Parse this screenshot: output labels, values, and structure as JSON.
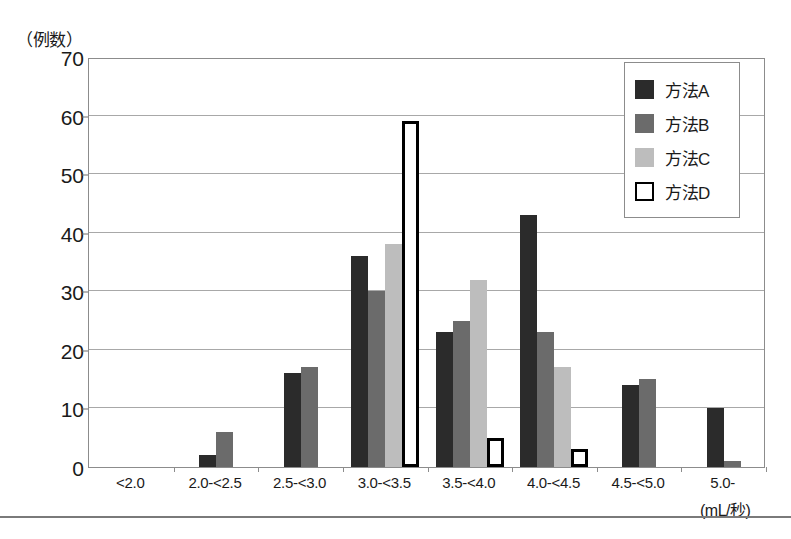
{
  "chart_data": {
    "type": "bar",
    "title": "",
    "subtitle": "",
    "xlabel": "(mL/秒)",
    "ylabel": "（例数）",
    "ylim": [
      0,
      70
    ],
    "yticks": [
      0,
      10,
      20,
      30,
      40,
      50,
      60,
      70
    ],
    "grid": true,
    "legend_position": "top-right",
    "categories": [
      "<2.0",
      "2.0-<2.5",
      "2.5-<3.0",
      "3.0-<3.5",
      "3.5-<4.0",
      "4.0-<4.5",
      "4.5-<5.0",
      "5.0-"
    ],
    "series": [
      {
        "name": "方法A",
        "color": "#2b2b2b",
        "style": "filled",
        "values": [
          0,
          2,
          16,
          36,
          23,
          43,
          14,
          10
        ]
      },
      {
        "name": "方法B",
        "color": "#6b6b6b",
        "style": "filled",
        "values": [
          0,
          6,
          17,
          30,
          25,
          23,
          15,
          1
        ]
      },
      {
        "name": "方法C",
        "color": "#bdbdbd",
        "style": "filled",
        "values": [
          0,
          0,
          0,
          38,
          32,
          17,
          0,
          0
        ]
      },
      {
        "name": "方法D",
        "color": "#ffffff",
        "style": "outlined",
        "values": [
          0,
          0,
          0,
          59,
          5,
          3,
          0,
          0
        ]
      }
    ]
  },
  "axis": {
    "y_unit_label": "（例数）",
    "x_unit_label": "(mL/秒)"
  },
  "legend": {
    "items": [
      {
        "label": "方法A",
        "swatch": "dark-filled-square"
      },
      {
        "label": "方法B",
        "swatch": "medium-gray-filled-square"
      },
      {
        "label": "方法C",
        "swatch": "light-gray-filled-square"
      },
      {
        "label": "方法D",
        "swatch": "white-outlined-square"
      }
    ]
  },
  "footer": {
    "caption": ""
  }
}
